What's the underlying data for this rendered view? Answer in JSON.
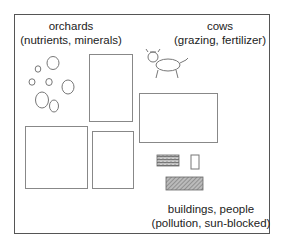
{
  "diagram": {
    "regions": [
      {
        "id": "orchards",
        "name": "orchards",
        "detail": "(nutrients, minerals)",
        "icon": "circles-icon"
      },
      {
        "id": "cows",
        "name": "cows",
        "detail": "(grazing, fertilizer)",
        "icon": "cow-icon"
      },
      {
        "id": "buildings",
        "name": "buildings, people",
        "detail": "(pollution, sun-blocked)",
        "icon": "buildings-icon"
      }
    ],
    "plots": [
      "plot-tall",
      "plot-wide",
      "plot-square",
      "plot-small"
    ],
    "colors": {
      "frame": "#555555",
      "plot_border": "#888888",
      "text": "#222222",
      "hatch": "#777777"
    }
  }
}
